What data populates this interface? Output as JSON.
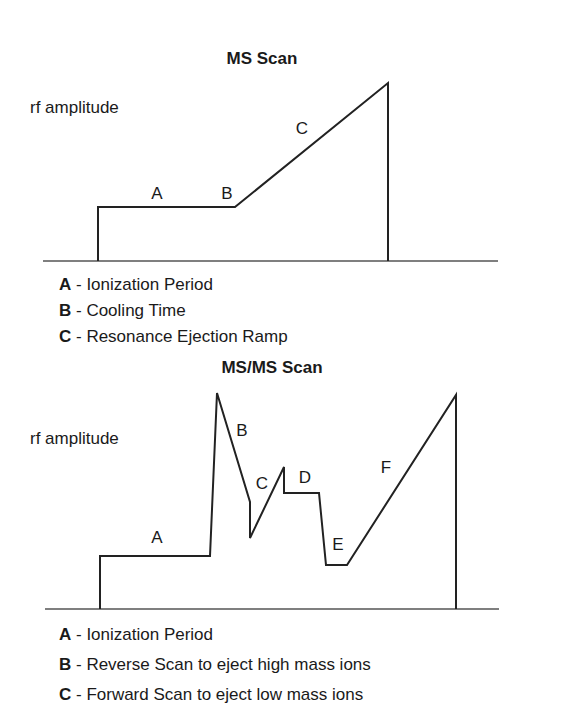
{
  "diagrams": [
    {
      "title": "MS Scan",
      "y_label": "rf amplitude",
      "trace_points": [
        [
          98,
          261
        ],
        [
          98,
          207
        ],
        [
          235,
          207
        ],
        [
          388,
          83
        ],
        [
          388,
          261
        ]
      ],
      "baseline": {
        "x1": 43,
        "x2": 498,
        "y": 261
      },
      "segment_labels": [
        {
          "key": "A",
          "x": 157,
          "y": 199
        },
        {
          "key": "B",
          "x": 227,
          "y": 199
        },
        {
          "key": "C",
          "x": 302,
          "y": 134
        }
      ],
      "legend": [
        {
          "key": "A",
          "text": " - Ionization Period"
        },
        {
          "key": "B",
          "text": " - Cooling Time"
        },
        {
          "key": "C",
          "text": " - Resonance Ejection Ramp"
        }
      ]
    },
    {
      "title": "MS/MS Scan",
      "y_label": "rf amplitude",
      "trace_points": [
        [
          100,
          609
        ],
        [
          100,
          556
        ],
        [
          210,
          556
        ],
        [
          217,
          393
        ],
        [
          250,
          502
        ],
        [
          250,
          538
        ],
        [
          284,
          467
        ],
        [
          284,
          493
        ],
        [
          319,
          493
        ],
        [
          326,
          565
        ],
        [
          347,
          565
        ],
        [
          456,
          395
        ],
        [
          456,
          609
        ]
      ],
      "baseline": {
        "x1": 45,
        "x2": 499,
        "y": 609
      },
      "segment_labels": [
        {
          "key": "A",
          "x": 157,
          "y": 543
        },
        {
          "key": "B",
          "x": 242,
          "y": 436
        },
        {
          "key": "C",
          "x": 262,
          "y": 489
        },
        {
          "key": "D",
          "x": 305,
          "y": 483
        },
        {
          "key": "E",
          "x": 338,
          "y": 550
        },
        {
          "key": "F",
          "x": 386,
          "y": 473
        }
      ],
      "legend": [
        {
          "key": "A",
          "text": " - Ionization Period"
        },
        {
          "key": "B",
          "text": " - Reverse Scan to eject high mass ions"
        },
        {
          "key": "C",
          "text": " - Forward Scan to eject low mass ions"
        }
      ]
    }
  ],
  "colors": {
    "line": "#222222",
    "text": "#1a1a1a",
    "baseline": "#555555"
  }
}
